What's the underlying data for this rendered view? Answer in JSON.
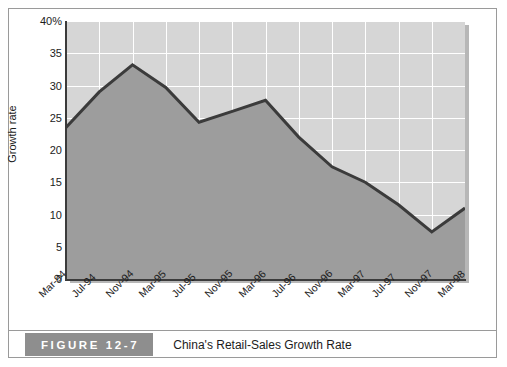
{
  "figure": {
    "badge_label": "FIGURE 12-7",
    "caption": "China's Retail-Sales Growth Rate"
  },
  "colors": {
    "plot_background": "#d6d6d6",
    "area_fill": "#9d9d9d",
    "line": "#3b3b3b",
    "gridline": "#ffffff",
    "axis": "#3b3b3b",
    "badge_background": "#8e8e8e",
    "frame_border": "#9a9a9a"
  },
  "chart_data": {
    "type": "area",
    "title": "China's Retail-Sales Growth Rate",
    "xlabel": "",
    "ylabel": "Growth rate",
    "categories": [
      "Mar-94",
      "Jul-94",
      "Nov-94",
      "Mar-95",
      "Jul-95",
      "Nov-95",
      "Mar-96",
      "Jul-96",
      "Nov-96",
      "Mar-97",
      "Jul-97",
      "Nov-97",
      "Mar-98"
    ],
    "values": [
      23.5,
      29.0,
      33.2,
      29.7,
      24.3,
      26.0,
      27.7,
      22.0,
      17.4,
      15.0,
      11.5,
      7.3,
      11.0
    ],
    "ylim": [
      0,
      40
    ],
    "yticks": [
      0,
      5,
      10,
      15,
      20,
      25,
      30,
      35,
      40
    ],
    "ytick_labels": [
      "0",
      "5",
      "10",
      "15",
      "20",
      "25",
      "30",
      "35",
      "40%"
    ],
    "grid": true,
    "legend": "none",
    "unit": "percent"
  }
}
